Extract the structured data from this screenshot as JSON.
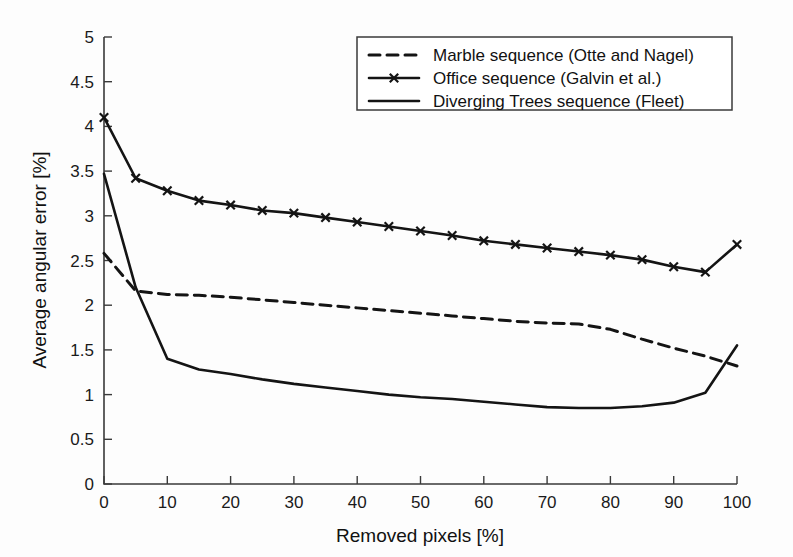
{
  "figure": {
    "background_color": "#fdfdfd",
    "line_color": "#141414",
    "axis_color": "#3a3a3a"
  },
  "chart_data": {
    "type": "line",
    "title": "",
    "xlabel": "Removed pixels [%]",
    "ylabel": "Average angular error [%]",
    "xlim": [
      0,
      100
    ],
    "ylim": [
      0,
      5
    ],
    "xticks": [
      0,
      10,
      20,
      30,
      40,
      50,
      60,
      70,
      80,
      90,
      100
    ],
    "xtick_labels": [
      "0",
      "10",
      "20",
      "30",
      "40",
      "50",
      "60",
      "70",
      "80",
      "90",
      "100"
    ],
    "yticks": [
      0,
      0.5,
      1,
      1.5,
      2,
      2.5,
      3,
      3.5,
      4,
      4.5,
      5
    ],
    "ytick_labels": [
      "0",
      "0.5",
      "1",
      "1.5",
      "2",
      "2.5",
      "3",
      "3.5",
      "4",
      "4.5",
      "5"
    ],
    "grid": false,
    "legend_position": "upper right",
    "x": [
      0,
      5,
      10,
      15,
      20,
      25,
      30,
      35,
      40,
      45,
      50,
      55,
      60,
      65,
      70,
      75,
      80,
      85,
      90,
      95,
      100
    ],
    "series": [
      {
        "name": "Marble sequence (Otte and Nagel)",
        "style": "dashed",
        "marker": "none",
        "values": [
          2.58,
          2.16,
          2.12,
          2.11,
          2.09,
          2.06,
          2.03,
          2.0,
          1.97,
          1.94,
          1.91,
          1.88,
          1.85,
          1.82,
          1.8,
          1.79,
          1.73,
          1.62,
          1.52,
          1.43,
          1.32
        ]
      },
      {
        "name": "Office sequence (Galvin et al.)",
        "style": "solid",
        "marker": "x",
        "values": [
          4.1,
          3.42,
          3.28,
          3.17,
          3.12,
          3.06,
          3.03,
          2.98,
          2.93,
          2.88,
          2.83,
          2.78,
          2.72,
          2.68,
          2.64,
          2.6,
          2.56,
          2.51,
          2.43,
          2.37,
          2.68
        ]
      },
      {
        "name": "Diverging Trees sequence (Fleet)",
        "style": "solid",
        "marker": "none",
        "values": [
          3.47,
          2.2,
          1.4,
          1.28,
          1.23,
          1.17,
          1.12,
          1.08,
          1.04,
          1.0,
          0.97,
          0.95,
          0.92,
          0.89,
          0.86,
          0.85,
          0.85,
          0.87,
          0.91,
          1.02,
          1.55
        ]
      }
    ]
  },
  "legend": {
    "entries": [
      {
        "label": "Marble sequence (Otte and Nagel)",
        "style": "dashed",
        "marker": "none"
      },
      {
        "label": "Office sequence (Galvin et al.)",
        "style": "solid",
        "marker": "x"
      },
      {
        "label": "Diverging Trees sequence (Fleet)",
        "style": "solid",
        "marker": "none"
      }
    ]
  }
}
